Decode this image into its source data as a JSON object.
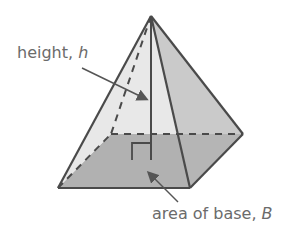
{
  "diagram": {
    "labels": {
      "height": {
        "text": "height, ",
        "var": "h"
      },
      "base": {
        "text": "area of base, ",
        "var": "B"
      }
    },
    "colors": {
      "edge": "#4a4a4a",
      "front_face": "#e6e6e6",
      "right_face": "#c8c8c8",
      "base": "#9a9a9a",
      "left_face": "#ececec",
      "label": "#6b6b6b"
    },
    "vertices": {
      "apex": [
        151,
        16
      ],
      "front_left": [
        58,
        188
      ],
      "front_right": [
        190,
        188
      ],
      "back_right": [
        243,
        134
      ],
      "back_left": [
        111,
        134
      ],
      "base_center": [
        151,
        160
      ]
    }
  }
}
